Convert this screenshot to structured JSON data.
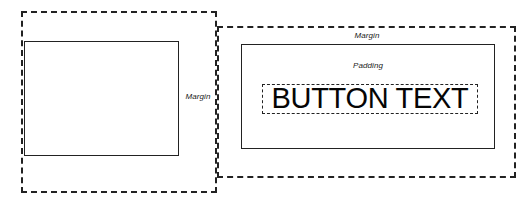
{
  "diagram": {
    "background_color": "#ffffff",
    "line_color": "#222222",
    "text_color": "#1a1a1a",
    "left_figure": {
      "margin_box_label": "Margin",
      "margin_box_style": "dashed",
      "content_box_style": "solid"
    },
    "right_figure": {
      "margin_box_label": "Margin",
      "margin_box_style": "dashed",
      "padding_box_label": "Padding",
      "padding_box_style": "solid",
      "button_text": "BUTTON TEXT",
      "button_text_box_style": "dashed"
    }
  }
}
